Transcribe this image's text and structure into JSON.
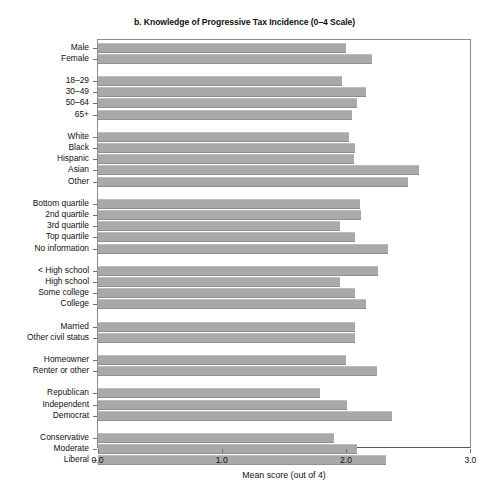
{
  "chart_data": {
    "type": "bar",
    "orientation": "horizontal",
    "title": "b. Knowledge of Progressive Tax Incidence (0–4 Scale)",
    "xlabel": "Mean score (out of 4)",
    "ylabel": "",
    "xlim": [
      0.0,
      3.0
    ],
    "xticks": [
      0.0,
      1.0,
      2.0,
      3.0
    ],
    "xtick_labels": [
      "0.0",
      "1.0",
      "2.0",
      "3.0"
    ],
    "grid": false,
    "legend": null,
    "bar_color": "#a9a9a9",
    "groups": [
      {
        "name": "gender",
        "categories": [
          "Male",
          "Female"
        ],
        "values": [
          2.0,
          2.21
        ]
      },
      {
        "name": "age",
        "categories": [
          "18–29",
          "30–49",
          "50–64",
          "65+"
        ],
        "values": [
          1.97,
          2.16,
          2.09,
          2.05
        ]
      },
      {
        "name": "race",
        "categories": [
          "White",
          "Black",
          "Hispanic",
          "Asian",
          "Other"
        ],
        "values": [
          2.02,
          2.07,
          2.06,
          2.59,
          2.5
        ]
      },
      {
        "name": "income",
        "categories": [
          "Bottom quartile",
          "2nd quartile",
          "3rd quartile",
          "Top quartile",
          "No information"
        ],
        "values": [
          2.11,
          2.12,
          1.95,
          2.07,
          2.34
        ]
      },
      {
        "name": "education",
        "categories": [
          "< High school",
          "High school",
          "Some college",
          "College"
        ],
        "values": [
          2.26,
          1.95,
          2.07,
          2.16
        ]
      },
      {
        "name": "civil_status",
        "categories": [
          "Married",
          "Other civil status"
        ],
        "values": [
          2.07,
          2.07
        ]
      },
      {
        "name": "housing",
        "categories": [
          "Homeowner",
          "Renter or other"
        ],
        "values": [
          2.0,
          2.25
        ]
      },
      {
        "name": "party",
        "categories": [
          "Republican",
          "Independent",
          "Democrat"
        ],
        "values": [
          1.79,
          2.01,
          2.37
        ]
      },
      {
        "name": "ideology",
        "categories": [
          "Conservative",
          "Moderate",
          "Liberal"
        ],
        "values": [
          1.9,
          2.09,
          2.32
        ]
      }
    ]
  }
}
